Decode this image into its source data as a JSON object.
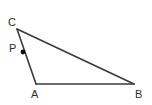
{
  "figure": {
    "kind": "geometry-diagram",
    "background_color": "#ffffff",
    "stroke_color": "#3a3a3a",
    "label_color": "#2b2b2b",
    "point_color": "#111111",
    "stroke_width": 1.6,
    "canvas": {
      "width": 152,
      "height": 105
    }
  },
  "labels": {
    "C": "C",
    "P": "P",
    "A": "A",
    "B": "B"
  },
  "points": {
    "C": {
      "x": 17,
      "y": 29
    },
    "A": {
      "x": 36,
      "y": 84
    },
    "B": {
      "x": 134,
      "y": 84
    },
    "P": {
      "x": 23,
      "y": 52,
      "radius": 2.4
    }
  },
  "segments": [
    {
      "name": "CA",
      "from": "C",
      "to": "A"
    },
    {
      "name": "AB",
      "from": "A",
      "to": "B"
    },
    {
      "name": "BC",
      "from": "B",
      "to": "C"
    }
  ]
}
